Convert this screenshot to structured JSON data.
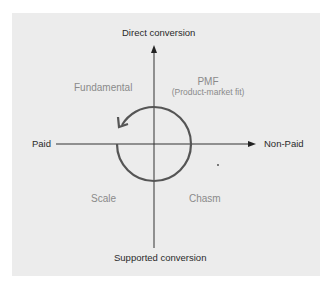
{
  "axes": {
    "top": "Direct conversion",
    "bottom": "Supported conversion",
    "left": "Paid",
    "right": "Non-Paid"
  },
  "quadrants": {
    "top_left": {
      "title": "Fundamental"
    },
    "top_right": {
      "title": "PMF",
      "subtitle": "(Product-market fit)"
    },
    "bottom_left": {
      "title": "Scale"
    },
    "bottom_right": {
      "title": "Chasm"
    }
  },
  "cycle": {
    "direction": "counter-clockwise arrow (flow from Chasm/Scale up to Fundamental)",
    "stroke_color": "#555555"
  },
  "colors": {
    "panel_background": "#ececec",
    "axis": "#333333",
    "axis_label": "#2a2a2a",
    "quadrant_label": "#8a8a8a"
  }
}
